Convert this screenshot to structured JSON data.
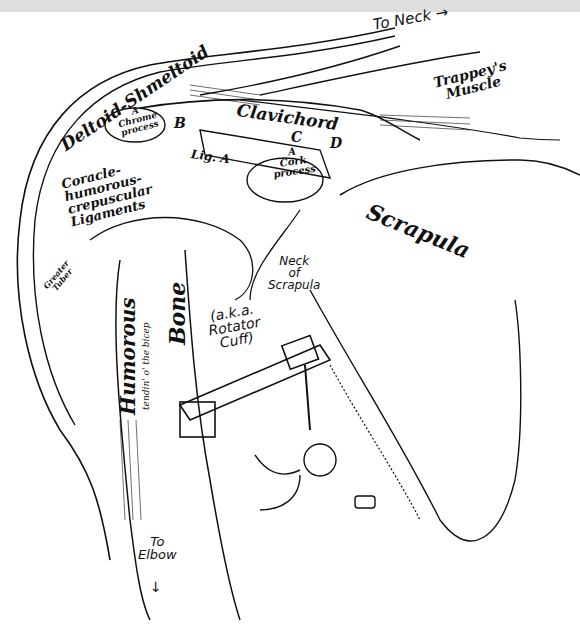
{
  "diagram": {
    "background": "#ffffff",
    "top_bar_color": "#dedede",
    "ink_color": "#111111",
    "labels": {
      "to_neck": "To Neck →",
      "trappeys_muscle": "Trappey's\nMuscle",
      "deltoid": "Deltoid-Shmeltoid",
      "clavichord": "Clavichord",
      "marker_b": "B",
      "marker_c": "C",
      "marker_d": "D",
      "chrome_process": "A\nChrome\nprocess",
      "lig_a": "Lig. A",
      "cork_process": "A\nCork\nprocess",
      "ligaments": "Coracle-\nhumorous-\ncrepuscular\nLigaments",
      "scrapula": "Scrapula",
      "greater_tuber": "Greater\nTuber",
      "neck_of_scrapula": "Neck\nof\nScrapula",
      "rotator_cuff": "(a.k.a.\nRotator\nCuff)",
      "humorous": "Humorous",
      "tendin": "tendin' o' the bicep",
      "bone": "Bone",
      "to_elbow": "To\nElbow",
      "elbow_arrow": "↓"
    },
    "figures": [
      "elf-figure hanging from wrench",
      "large wrench clamped on bone",
      "dropped bolt/socket"
    ]
  }
}
